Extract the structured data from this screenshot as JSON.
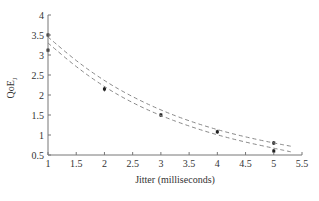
{
  "chart_data": {
    "type": "scatter",
    "title": "",
    "xlabel": "Jitter (milliseconds)",
    "ylabel": "QoE",
    "ylabel_sub": "J",
    "xlim": [
      1,
      5.5
    ],
    "ylim": [
      0.5,
      4
    ],
    "x_ticks": [
      1,
      1.5,
      2,
      2.5,
      3,
      3.5,
      4,
      4.5,
      5,
      5.5
    ],
    "y_ticks": [
      0.5,
      1,
      1.5,
      2,
      2.5,
      3,
      3.5,
      4
    ],
    "grid": false,
    "series": [
      {
        "name": "measured",
        "style": "points-with-errorbars",
        "points": [
          {
            "x": 1,
            "y": 3.5,
            "err": 0.02
          },
          {
            "x": 1,
            "y": 3.12,
            "err": 0.02
          },
          {
            "x": 2,
            "y": 2.15,
            "err": 0.06
          },
          {
            "x": 3,
            "y": 1.5,
            "err": 0.05
          },
          {
            "x": 4,
            "y": 1.08,
            "err": 0.03
          },
          {
            "x": 5,
            "y": 0.8,
            "err": 0.02
          },
          {
            "x": 5,
            "y": 0.6,
            "err": 0.02
          }
        ]
      },
      {
        "name": "upper fit",
        "style": "dashed",
        "x": [
          1,
          1.5,
          2,
          2.5,
          3,
          3.5,
          4,
          4.5,
          5,
          5.3
        ],
        "y": [
          3.45,
          2.85,
          2.35,
          1.95,
          1.62,
          1.35,
          1.13,
          0.95,
          0.8,
          0.72
        ]
      },
      {
        "name": "lower fit",
        "style": "dashed",
        "x": [
          1,
          1.5,
          2,
          2.5,
          3,
          3.5,
          4,
          4.5,
          5,
          5.3
        ],
        "y": [
          3.3,
          2.7,
          2.2,
          1.8,
          1.48,
          1.22,
          1.0,
          0.82,
          0.67,
          0.58
        ]
      }
    ],
    "legend": null
  }
}
